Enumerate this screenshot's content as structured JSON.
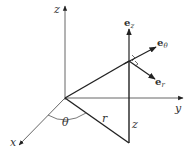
{
  "diagram": {
    "type": "cylindrical-coordinates",
    "axes": {
      "x": {
        "label": "x"
      },
      "y": {
        "label": "y"
      },
      "z": {
        "label": "z"
      }
    },
    "angle": {
      "label": "θ"
    },
    "radius": {
      "label": "r"
    },
    "height": {
      "label": "z"
    },
    "unit_vectors": [
      {
        "base": "e",
        "sub": "z"
      },
      {
        "base": "e",
        "sub": "θ"
      },
      {
        "base": "e",
        "sub": "r"
      }
    ],
    "colors": {
      "stroke": "#222222",
      "axis": "#555555",
      "text": "#333333"
    }
  }
}
